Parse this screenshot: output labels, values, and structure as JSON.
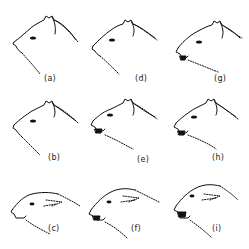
{
  "figure": {
    "panels": [
      {
        "id": "a",
        "label": "(a)",
        "expression": "neutral, ears up, mouth closed"
      },
      {
        "id": "b",
        "label": "(b)",
        "expression": "ears up, mouth closed"
      },
      {
        "id": "c",
        "label": "(c)",
        "expression": "ears flattened back, mouth closed"
      },
      {
        "id": "d",
        "label": "(d)",
        "expression": "ears up, mouth slightly open"
      },
      {
        "id": "e",
        "label": "(e)",
        "expression": "ears up, mouth open, teeth showing"
      },
      {
        "id": "f",
        "label": "(f)",
        "expression": "ears back, mouth open"
      },
      {
        "id": "g",
        "label": "(g)",
        "expression": "ears up, mouth open"
      },
      {
        "id": "h",
        "label": "(h)",
        "expression": "ears up, mouth open, snarling"
      },
      {
        "id": "i",
        "label": "(i)",
        "expression": "ears flattened, mouth wide open, snarling"
      }
    ]
  }
}
